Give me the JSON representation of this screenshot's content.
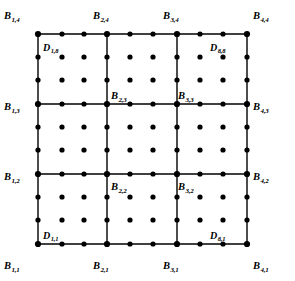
{
  "figure": {
    "type": "lattice-diagram",
    "colors": {
      "background": "#ffffff",
      "line": "#000000",
      "node": "#000000",
      "dot": "#000000"
    },
    "geometry": {
      "grid_x": [
        38,
        107,
        177,
        247
      ],
      "grid_y": [
        34,
        104,
        174,
        244
      ],
      "dot_x": [
        38,
        62,
        84,
        107,
        130,
        153,
        177,
        200,
        223,
        247
      ],
      "dot_y": [
        34,
        57,
        80,
        104,
        127,
        150,
        174,
        197,
        220,
        244
      ],
      "node_radius": 3.1,
      "dot_radius": 2.6,
      "line_width": 1.4
    }
  },
  "chart_data": {
    "type": "scatter",
    "title": "",
    "xlabel": "",
    "ylabel": "",
    "grid": true,
    "legend": "none",
    "series": [
      {
        "name": "B control points",
        "marker": "filled-circle-large",
        "points": [
          {
            "label_i": 1,
            "label_j": 1,
            "x": 38,
            "y": 244
          },
          {
            "label_i": 2,
            "label_j": 1,
            "x": 107,
            "y": 244
          },
          {
            "label_i": 3,
            "label_j": 1,
            "x": 177,
            "y": 244
          },
          {
            "label_i": 4,
            "label_j": 1,
            "x": 247,
            "y": 244
          },
          {
            "label_i": 1,
            "label_j": 2,
            "x": 38,
            "y": 174
          },
          {
            "label_i": 2,
            "label_j": 2,
            "x": 107,
            "y": 174
          },
          {
            "label_i": 3,
            "label_j": 2,
            "x": 177,
            "y": 174
          },
          {
            "label_i": 4,
            "label_j": 2,
            "x": 247,
            "y": 174
          },
          {
            "label_i": 1,
            "label_j": 3,
            "x": 38,
            "y": 104
          },
          {
            "label_i": 2,
            "label_j": 3,
            "x": 107,
            "y": 104
          },
          {
            "label_i": 3,
            "label_j": 3,
            "x": 177,
            "y": 104
          },
          {
            "label_i": 4,
            "label_j": 3,
            "x": 247,
            "y": 104
          },
          {
            "label_i": 1,
            "label_j": 4,
            "x": 38,
            "y": 34
          },
          {
            "label_i": 2,
            "label_j": 4,
            "x": 107,
            "y": 34
          },
          {
            "label_i": 3,
            "label_j": 4,
            "x": 177,
            "y": 34
          },
          {
            "label_i": 4,
            "label_j": 4,
            "x": 247,
            "y": 34
          }
        ]
      },
      {
        "name": "D data points",
        "marker": "filled-circle-small",
        "count": 100,
        "description": "10x10 lattice of sample points spanning the patch"
      }
    ]
  },
  "labels": {
    "b_points": [
      {
        "name": "B_1_4",
        "base": "B",
        "sub": "1,4",
        "x": 4,
        "y": 6,
        "anchor": "top-left"
      },
      {
        "name": "B_2_4",
        "base": "B",
        "sub": "2,4",
        "x": 93,
        "y": 6,
        "anchor": "top-left"
      },
      {
        "name": "B_3_4",
        "base": "B",
        "sub": "3,4",
        "x": 163,
        "y": 6,
        "anchor": "top-left"
      },
      {
        "name": "B_4_4",
        "base": "B",
        "sub": "4,4",
        "x": 253,
        "y": 6,
        "anchor": "top-left"
      },
      {
        "name": "B_1_3",
        "base": "B",
        "sub": "1,3",
        "x": 4,
        "y": 97,
        "anchor": "left"
      },
      {
        "name": "B_2_3",
        "base": "B",
        "sub": "2,3",
        "x": 111,
        "y": 86,
        "anchor": "left"
      },
      {
        "name": "B_3_3",
        "base": "B",
        "sub": "3,3",
        "x": 178,
        "y": 86,
        "anchor": "left"
      },
      {
        "name": "B_4_3",
        "base": "B",
        "sub": "4,3",
        "x": 253,
        "y": 97,
        "anchor": "left"
      },
      {
        "name": "B_1_2",
        "base": "B",
        "sub": "1,2",
        "x": 4,
        "y": 167,
        "anchor": "left"
      },
      {
        "name": "B_2_2",
        "base": "B",
        "sub": "2,2",
        "x": 111,
        "y": 177,
        "anchor": "left"
      },
      {
        "name": "B_3_2",
        "base": "B",
        "sub": "3,2",
        "x": 178,
        "y": 177,
        "anchor": "left"
      },
      {
        "name": "B_4_2",
        "base": "B",
        "sub": "4,2",
        "x": 253,
        "y": 167,
        "anchor": "left"
      },
      {
        "name": "B_1_1",
        "base": "B",
        "sub": "1,1",
        "x": 4,
        "y": 256,
        "anchor": "bottom-left"
      },
      {
        "name": "B_2_1",
        "base": "B",
        "sub": "2,1",
        "x": 93,
        "y": 256,
        "anchor": "bottom-left"
      },
      {
        "name": "B_3_1",
        "base": "B",
        "sub": "3,1",
        "x": 163,
        "y": 256,
        "anchor": "bottom-left"
      },
      {
        "name": "B_4_1",
        "base": "B",
        "sub": "4,1",
        "x": 253,
        "y": 256,
        "anchor": "bottom-left"
      }
    ],
    "d_points": [
      {
        "name": "D_1_8",
        "base": "D",
        "sub": "1,8",
        "x": 43,
        "y": 38
      },
      {
        "name": "D_8_8",
        "base": "D",
        "sub": "8,8",
        "x": 210,
        "y": 38
      },
      {
        "name": "D_1_1",
        "base": "D",
        "sub": "1,1",
        "x": 43,
        "y": 226
      },
      {
        "name": "D_8_1",
        "base": "D",
        "sub": "8,1",
        "x": 210,
        "y": 226
      }
    ]
  }
}
